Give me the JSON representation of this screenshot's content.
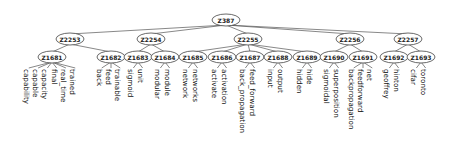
{
  "diagram": {
    "type": "tree",
    "orientation": "top-down",
    "leaf_label_rotation": 90,
    "root": {
      "id": "Z387",
      "label": "Z387",
      "x": 226,
      "y": 20,
      "children": [
        {
          "id": "Z2253",
          "label": "Z2253",
          "x": 70,
          "y": 39,
          "children": [
            {
              "id": "Z1681",
              "label": "Z1681",
              "x": 52,
              "y": 57,
              "leaves": [
                "capability",
                "capable",
                "capacity",
                "final",
                "real_time",
                "trained"
              ]
            },
            {
              "id": "Z1682",
              "label": "Z1682",
              "x": 111,
              "y": 57,
              "leaves": [
                "back",
                "feed",
                "trainable"
              ]
            }
          ]
        },
        {
          "id": "Z2254",
          "label": "Z2254",
          "x": 151,
          "y": 39,
          "children": [
            {
              "id": "Z1683",
              "label": "Z1683",
              "x": 138,
              "y": 57,
              "leaves": [
                "sigmoid",
                "unit"
              ]
            },
            {
              "id": "Z1684",
              "label": "Z1684",
              "x": 165,
              "y": 57,
              "leaves": [
                "modular",
                "module"
              ]
            }
          ]
        },
        {
          "id": "Z2255",
          "label": "Z2255",
          "x": 248,
          "y": 39,
          "children": [
            {
              "id": "Z1685",
              "label": "Z1685",
              "x": 193,
              "y": 57,
              "leaves": [
                "network",
                "networks"
              ]
            },
            {
              "id": "Z1686",
              "label": "Z1686",
              "x": 222,
              "y": 57,
              "leaves": [
                "activate",
                "activation"
              ]
            },
            {
              "id": "Z1687",
              "label": "Z1687",
              "x": 250,
              "y": 57,
              "leaves": [
                "back_propagation",
                "feed_forward"
              ]
            },
            {
              "id": "Z1688",
              "label": "Z1688",
              "x": 278,
              "y": 57,
              "leaves": [
                "input",
                "output"
              ]
            },
            {
              "id": "Z1689",
              "label": "Z1689",
              "x": 307,
              "y": 57,
              "leaves": [
                "hidden",
                "hide"
              ]
            }
          ]
        },
        {
          "id": "Z2256",
          "label": "Z2256",
          "x": 350,
          "y": 39,
          "children": [
            {
              "id": "Z1690",
              "label": "Z1690",
              "x": 334,
              "y": 57,
              "leaves": [
                "sigmoidal",
                "superposition"
              ]
            },
            {
              "id": "Z1691",
              "label": "Z1691",
              "x": 363,
              "y": 57,
              "leaves": [
                "backpropagation",
                "feedforward",
                "net"
              ]
            }
          ]
        },
        {
          "id": "Z2257",
          "label": "Z2257",
          "x": 408,
          "y": 39,
          "children": [
            {
              "id": "Z1692",
              "label": "Z1692",
              "x": 394,
              "y": 57,
              "leaves": [
                "geoffrey",
                "hinton"
              ]
            },
            {
              "id": "Z1693",
              "label": "Z1693",
              "x": 421,
              "y": 57,
              "leaves": [
                "cifar",
                "toronto"
              ]
            }
          ]
        }
      ]
    }
  },
  "colors": {
    "background": "#ffffff",
    "node_fill": "#ffffff",
    "node_stroke": "#444444",
    "edge": "#555555",
    "text": "#111111"
  }
}
